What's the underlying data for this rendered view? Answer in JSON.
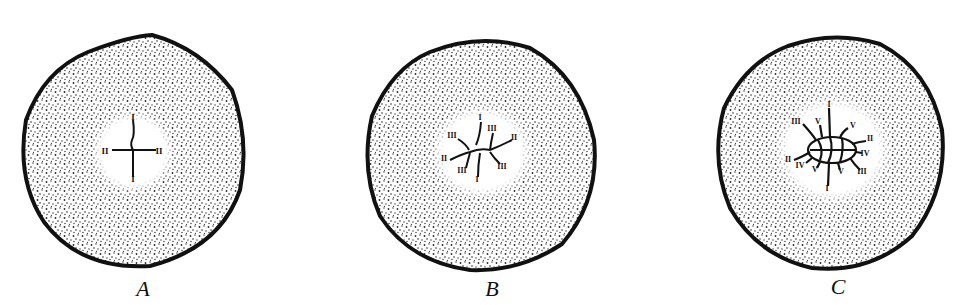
{
  "figure": {
    "colors": {
      "outline": "#111111",
      "stipple": "#2a2a2a",
      "background": "#ffffff"
    },
    "panels": [
      {
        "id": "A",
        "label": "A",
        "center": [
          133,
          154
        ],
        "radius": 112,
        "pole_labels": [
          {
            "text": "I",
            "pos": [
              133,
              118
            ]
          },
          {
            "text": "II",
            "pos": [
              105,
              152
            ]
          },
          {
            "text": "II",
            "pos": [
              159,
              152
            ]
          },
          {
            "text": "I",
            "pos": [
              133,
              180
            ]
          }
        ]
      },
      {
        "id": "B",
        "label": "B",
        "center": [
          482,
          155
        ],
        "radius": 113,
        "pole_labels": [
          {
            "text": "I",
            "pos": [
              480,
              118
            ]
          },
          {
            "text": "III",
            "pos": [
              452,
              136
            ]
          },
          {
            "text": "III",
            "pos": [
              492,
              129
            ]
          },
          {
            "text": "II",
            "pos": [
              514,
              138
            ]
          },
          {
            "text": "II",
            "pos": [
              444,
              159
            ]
          },
          {
            "text": "III",
            "pos": [
              462,
              171
            ]
          },
          {
            "text": "III",
            "pos": [
              502,
              167
            ]
          },
          {
            "text": "I",
            "pos": [
              477,
              180
            ]
          }
        ]
      },
      {
        "id": "C",
        "label": "C",
        "center": [
          833,
          155
        ],
        "radius": 113,
        "pole_labels": [
          {
            "text": "I",
            "pos": [
              829,
              105
            ]
          },
          {
            "text": "III",
            "pos": [
              796,
              122
            ]
          },
          {
            "text": "V",
            "pos": [
              818,
              122
            ]
          },
          {
            "text": "V",
            "pos": [
              853,
              126
            ]
          },
          {
            "text": "II",
            "pos": [
              870,
              139
            ]
          },
          {
            "text": "IV",
            "pos": [
              865,
              154
            ]
          },
          {
            "text": "II",
            "pos": [
              788,
              160
            ]
          },
          {
            "text": "IV",
            "pos": [
              800,
              166
            ]
          },
          {
            "text": "V",
            "pos": [
              815,
              170
            ]
          },
          {
            "text": "V",
            "pos": [
              841,
              172
            ]
          },
          {
            "text": "III",
            "pos": [
              862,
              172
            ]
          },
          {
            "text": "I",
            "pos": [
              827,
              189
            ]
          }
        ]
      }
    ]
  }
}
